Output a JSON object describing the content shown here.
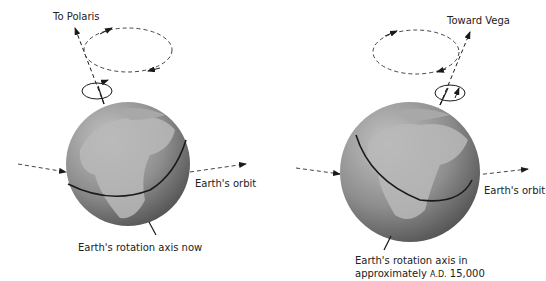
{
  "left_panel": {
    "star_label": "To Polaris",
    "orbit_label": "Earth's orbit",
    "axis_label": "Earth's rotation axis now"
  },
  "right_panel": {
    "star_label": "Toward Vega",
    "orbit_label": "Earth's orbit",
    "axis_label_line1": "Earth's rotation axis in",
    "axis_label_line2_prefix": "approximately ",
    "axis_label_line2_era": "A.D.",
    "axis_label_line2_year": " 15,000"
  },
  "colors": {
    "globe_ocean": "#8a8a8a",
    "globe_land": "#b8b8b8",
    "globe_shadow": "#5e5e5e",
    "line": "#1a1a1a",
    "dashed": "#444444"
  }
}
